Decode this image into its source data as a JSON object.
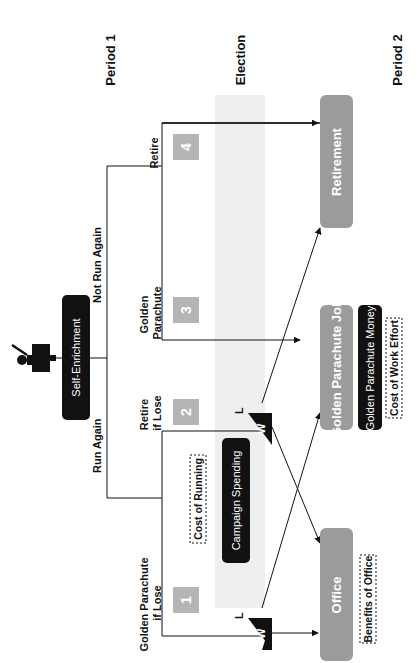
{
  "headers": {
    "period1": "Period 1",
    "election": "Election",
    "period2": "Period 2"
  },
  "root": {
    "label": "Self-Enrichment",
    "icon": "politician-at-podium-icon"
  },
  "branches": {
    "run_again": "Run Again",
    "not_run_again": "Not Run Again"
  },
  "options": [
    {
      "num": "1",
      "label_line1": "Golden Parachute",
      "label_line2": "if Lose"
    },
    {
      "num": "2",
      "label_line1": "Retire",
      "label_line2": "if Lose"
    },
    {
      "num": "3",
      "label_line1": "Golden",
      "label_line2": "Parachute"
    },
    {
      "num": "4",
      "label_line1": "Retire",
      "label_line2": ""
    }
  ],
  "costs": {
    "cost_of_running": "Cost of Running",
    "campaign_spending": "Campaign Spending"
  },
  "election_outcomes": {
    "win": "W",
    "lose": "L"
  },
  "outcomes": {
    "office": "Office",
    "golden_parachute_job": "Golden Parachute Job",
    "retirement": "Retirement"
  },
  "outcome_details": {
    "benefits_of_office": "Benefits of Office",
    "golden_parachute_money": "Golden Parachute Money",
    "cost_of_work_effort": "Cost of Work Effort"
  },
  "colors": {
    "dark": "#111111",
    "gray_box": "#9b9b9b",
    "num_box": "#b5b5b5",
    "band": "#efefef"
  }
}
